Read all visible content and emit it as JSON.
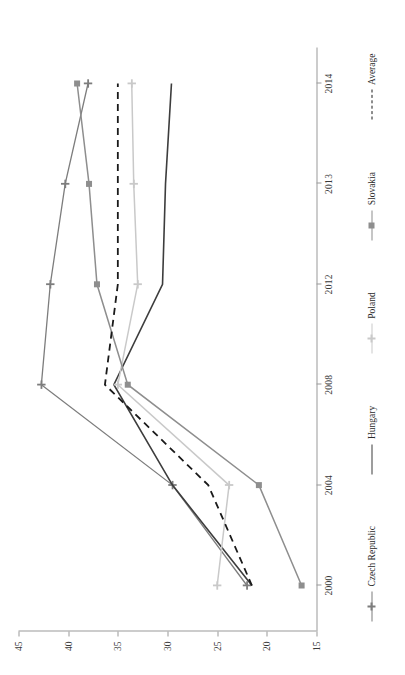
{
  "chart_data": {
    "type": "line",
    "title": "",
    "subtitle": "",
    "xlabel": "",
    "ylabel": "",
    "orientation": "rotated-90",
    "grid": false,
    "legend_position": "bottom",
    "x": [
      "2000",
      "2004",
      "2008",
      "2012",
      "2013",
      "2014"
    ],
    "xtick_labels": [
      "2000",
      "2004",
      "2008",
      "2012",
      "2013",
      "2014"
    ],
    "ytick_labels": [
      "15",
      "20",
      "25",
      "30",
      "35",
      "40",
      "45"
    ],
    "ytick_values": [
      15,
      20,
      25,
      30,
      35,
      40,
      45
    ],
    "ylim": [
      15,
      45
    ],
    "series": [
      {
        "name": "Czech Republic",
        "color": "#7d7d7d",
        "marker": "plus",
        "dash": false,
        "width": 1.3,
        "values": [
          22.0,
          29.5,
          42.7,
          41.8,
          40.3,
          38.0
        ]
      },
      {
        "name": "Hungary",
        "color": "#3d3d3d",
        "marker": "none",
        "dash": false,
        "width": 1.6,
        "values": [
          21.5,
          29.5,
          35.4,
          30.5,
          30.2,
          29.6
        ]
      },
      {
        "name": "Poland",
        "color": "#c9c9c9",
        "marker": "plus",
        "dash": false,
        "width": 1.5,
        "values": [
          25.0,
          23.8,
          35.0,
          33.0,
          33.4,
          33.6
        ]
      },
      {
        "name": "Slovakia",
        "color": "#8e8e8e",
        "marker": "square",
        "dash": false,
        "width": 1.5,
        "values": [
          16.5,
          20.8,
          34.0,
          37.1,
          37.9,
          39.1
        ]
      },
      {
        "name": "Average",
        "color": "#1a1a1a",
        "marker": "none",
        "dash": true,
        "width": 1.8,
        "values": [
          21.5,
          25.9,
          36.3,
          35.0,
          35.0,
          35.0
        ]
      }
    ]
  },
  "legend": {
    "items": [
      {
        "label": "Czech Republic"
      },
      {
        "label": "Hungary"
      },
      {
        "label": "Poland"
      },
      {
        "label": "Slovakia"
      },
      {
        "label": "Average"
      }
    ]
  }
}
